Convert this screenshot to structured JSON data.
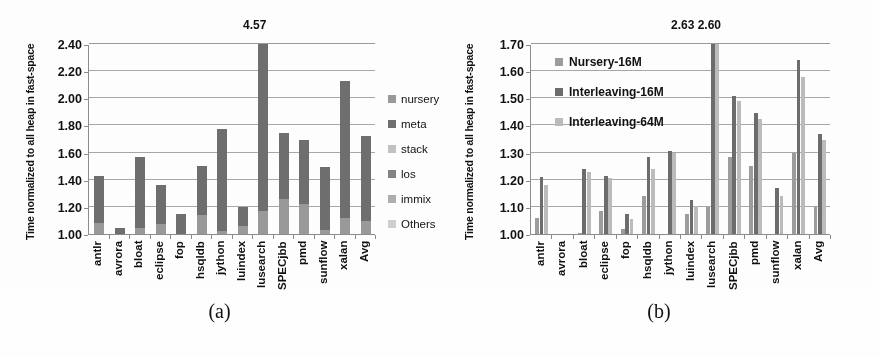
{
  "figure": {
    "panels": [
      {
        "caption": "(a)",
        "ylabel": "Time normalized to all heap in fast-space",
        "yticks": [
          "1.00",
          "1.20",
          "1.40",
          "1.60",
          "1.80",
          "2.00",
          "2.20",
          "2.40"
        ],
        "annotation": "4.57",
        "legend_title": "",
        "legend": [
          {
            "label": "nursery",
            "color": "#9a9a9a"
          },
          {
            "label": "meta",
            "color": "#6f6f6f"
          },
          {
            "label": "stack",
            "color": "#c3c3c3"
          },
          {
            "label": "los",
            "color": "#848484"
          },
          {
            "label": "immix",
            "color": "#b0b0b0"
          },
          {
            "label": "Others",
            "color": "#d2d2d2"
          }
        ]
      },
      {
        "caption": "(b)",
        "ylabel": "Time normalized to all heap in fast-space",
        "yticks": [
          "1.00",
          "1.10",
          "1.20",
          "1.30",
          "1.40",
          "1.50",
          "1.60",
          "1.70"
        ],
        "annotation": "2.63 2.60",
        "legend": [
          {
            "label": "Nursery-16M",
            "color": "#9d9d9d"
          },
          {
            "label": "Interleaving-16M",
            "color": "#6d6d6d"
          },
          {
            "label": "Interleaving-64M",
            "color": "#bdbdbd"
          }
        ]
      }
    ]
  },
  "chart_data": [
    {
      "type": "bar",
      "stacked": true,
      "title": "",
      "xlabel": "",
      "ylabel": "Time normalized to all heap in fast-space",
      "ylim": [
        1.0,
        2.5
      ],
      "ytick_step": 0.2,
      "grid": true,
      "legend_position": "right",
      "categories": [
        "antlr",
        "avrora",
        "bloat",
        "eclipse",
        "fop",
        "hsqldb",
        "jython",
        "luindex",
        "lusearch",
        "SPECjbb",
        "pmd",
        "sunflow",
        "xalan",
        "Avg"
      ],
      "series": [
        {
          "name": "nursery",
          "color": "#9a9a9a",
          "values": [
            0.09,
            0.0,
            0.05,
            0.08,
            0.0,
            0.15,
            0.02,
            0.06,
            0.18,
            0.28,
            0.24,
            0.03,
            0.13,
            0.1
          ]
        },
        {
          "name": "meta",
          "color": "#6f6f6f",
          "values": [
            0.37,
            0.05,
            0.56,
            0.31,
            0.16,
            0.39,
            0.81,
            0.15,
            1.32,
            0.52,
            0.5,
            0.5,
            1.08,
            0.67
          ]
        },
        {
          "name": "stack",
          "color": "#c3c3c3",
          "values": [
            0.0,
            0.0,
            0.0,
            0.0,
            0.0,
            0.0,
            0.0,
            0.0,
            0.0,
            0.0,
            0.0,
            0.0,
            0.0,
            0.0
          ]
        },
        {
          "name": "los",
          "color": "#848484",
          "values": [
            0.0,
            0.0,
            0.0,
            0.0,
            0.0,
            0.0,
            0.0,
            0.0,
            0.0,
            0.0,
            0.0,
            0.0,
            0.0,
            0.0
          ]
        },
        {
          "name": "immix",
          "color": "#b0b0b0",
          "values": [
            0.0,
            0.0,
            0.0,
            0.0,
            0.0,
            0.0,
            0.0,
            0.0,
            0.0,
            0.0,
            0.0,
            0.0,
            0.0,
            0.0
          ]
        },
        {
          "name": "Others",
          "color": "#d2d2d2",
          "values": [
            0.0,
            0.0,
            0.0,
            0.0,
            0.0,
            0.0,
            0.0,
            0.0,
            0.0,
            0.0,
            0.0,
            0.0,
            0.0,
            0.0
          ]
        }
      ],
      "totals": [
        1.46,
        1.05,
        1.61,
        1.39,
        1.16,
        1.54,
        1.83,
        1.21,
        4.57,
        1.8,
        1.74,
        1.53,
        2.21,
        1.77
      ],
      "annotations": [
        {
          "category": "lusearch",
          "text": "4.57",
          "clipped": true
        }
      ]
    },
    {
      "type": "bar",
      "stacked": false,
      "title": "",
      "xlabel": "",
      "ylabel": "Time normalized to all heap in fast-space",
      "ylim": [
        1.0,
        1.7
      ],
      "ytick_step": 0.1,
      "grid": true,
      "legend_position": "inside-top-left",
      "categories": [
        "antlr",
        "avrora",
        "bloat",
        "eclipse",
        "fop",
        "hsqldb",
        "jython",
        "luindex",
        "lusearch",
        "SPECjbb",
        "pmd",
        "sunflow",
        "xalan",
        "Avg"
      ],
      "series": [
        {
          "name": "Nursery-16M",
          "color": "#9d9d9d",
          "values": [
            1.06,
            1.0,
            1.005,
            1.085,
            1.02,
            1.14,
            1.0,
            1.075,
            1.1,
            1.285,
            1.25,
            1.0,
            1.3,
            1.1
          ]
        },
        {
          "name": "Interleaving-16M",
          "color": "#6d6d6d",
          "values": [
            1.21,
            1.0,
            1.24,
            1.215,
            1.075,
            1.285,
            1.305,
            1.125,
            2.63,
            1.51,
            1.445,
            1.17,
            1.64,
            1.37
          ]
        },
        {
          "name": "Interleaving-64M",
          "color": "#bdbdbd",
          "values": [
            1.18,
            1.0,
            1.23,
            1.205,
            1.055,
            1.24,
            1.3,
            1.105,
            2.6,
            1.49,
            1.425,
            1.14,
            1.58,
            1.345
          ]
        }
      ],
      "annotations": [
        {
          "category": "lusearch",
          "text": "2.63 2.60",
          "clipped": true
        }
      ]
    }
  ]
}
